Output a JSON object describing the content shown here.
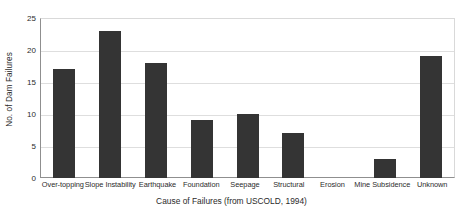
{
  "chart_data": {
    "type": "bar",
    "title": "",
    "xlabel": "Cause of Failures (from USCOLD, 1994)",
    "ylabel": "No. of Dam Failures",
    "categories": [
      "Over-topping",
      "Slope Instability",
      "Earthquake",
      "Foundation",
      "Seepage",
      "Structural",
      "Erosion",
      "Mine Subsidence",
      "Unknown"
    ],
    "values": [
      17,
      23,
      18,
      9,
      10,
      7,
      0,
      3,
      19
    ],
    "ylim": [
      0,
      25
    ],
    "y_ticks": [
      0,
      5,
      10,
      15,
      20,
      25
    ],
    "grid": true,
    "legend": "none",
    "bar_color": "#343434",
    "gridline_color": "#dedede",
    "axis_color": "#8f8f8f",
    "background_color": "#ffffff"
  }
}
